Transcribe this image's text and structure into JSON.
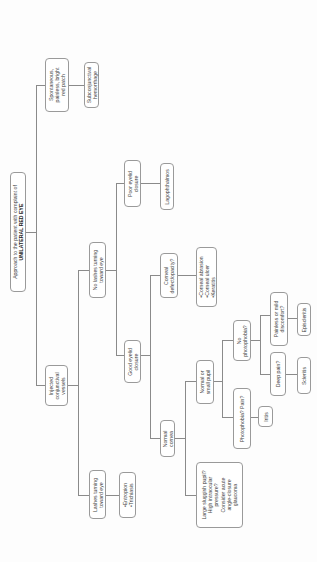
{
  "diagram": {
    "title_line1": "Approach to the patient with complaint of",
    "title_line2": "UNILATERAL RED EYE",
    "nodes": {
      "spontaneous": {
        "lines": [
          "Spontaneous,",
          "painless, bright",
          "red patch"
        ]
      },
      "subconjunctival": {
        "lines": [
          "Subconjunctival",
          "hemorrhage"
        ]
      },
      "injected": {
        "lines": [
          "Injected",
          "conjunctival",
          "vessels"
        ]
      },
      "no_lashes": {
        "lines": [
          "No lashes turning",
          "toward eye"
        ]
      },
      "lashes": {
        "lines": [
          "Lashes turning",
          "toward eye"
        ]
      },
      "entropion": {
        "items": [
          "Entropion",
          "Trichiasis"
        ]
      },
      "poor_closure": {
        "lines": [
          "Poor eyelid",
          "closure"
        ]
      },
      "lagophthalmos": {
        "lines": [
          "Lagophthalmos"
        ]
      },
      "good_closure": {
        "lines": [
          "Good eyelid",
          "closure"
        ]
      },
      "corneal_defect": {
        "lines": [
          "Corneal",
          "defect/opacity?"
        ]
      },
      "corneal_dx": {
        "items": [
          "Corneal abrasion",
          "Corneal ulcer",
          "Keratitis"
        ]
      },
      "normal_cornea": {
        "lines": [
          "Normal",
          "cornea"
        ]
      },
      "large_pupil": {
        "lines": [
          "Large sluggish pupil?",
          "High intraocular",
          "pressure?",
          "Consider acute",
          "angle-closure",
          "glaucoma"
        ]
      },
      "normal_pupil": {
        "lines": [
          "Normal or",
          "small pupil"
        ]
      },
      "photophobia": {
        "lines": [
          "Photophobia? Pain?"
        ]
      },
      "iritis": {
        "lines": [
          "Iritis"
        ]
      },
      "no_photophobia": {
        "lines": [
          "No",
          "photophobia?"
        ]
      },
      "painless": {
        "lines": [
          "Painless or mild",
          "discomfort?"
        ]
      },
      "episcleritis": {
        "lines": [
          "Episcleritis"
        ]
      },
      "deep_pain": {
        "lines": [
          "Deep pain?"
        ]
      },
      "scleritis": {
        "lines": [
          "Scleritis"
        ]
      }
    }
  }
}
